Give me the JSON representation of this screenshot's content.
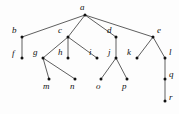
{
  "figure": {
    "name": "rooted-tree-diagram",
    "type": "node-link-tree",
    "background_color": "#fdfdfd",
    "node_color": "#111111",
    "edge_color": "#1a1a1a",
    "label_style": "italic-serif",
    "width": 179,
    "height": 114
  },
  "nodes": [
    {
      "id": "a",
      "label": "a",
      "x": 85,
      "y": 15,
      "label_x": 80,
      "label_y": 3,
      "level": 0
    },
    {
      "id": "b",
      "label": "b",
      "x": 22,
      "y": 37,
      "label_x": 12,
      "label_y": 26,
      "level": 1
    },
    {
      "id": "c",
      "label": "c",
      "x": 68,
      "y": 37,
      "label_x": 58,
      "label_y": 26,
      "level": 1
    },
    {
      "id": "d",
      "label": "d",
      "x": 116,
      "y": 37,
      "label_x": 107,
      "label_y": 26,
      "level": 1
    },
    {
      "id": "e",
      "label": "e",
      "x": 153,
      "y": 37,
      "label_x": 157,
      "label_y": 26,
      "level": 1
    },
    {
      "id": "f",
      "label": "f",
      "x": 22,
      "y": 58,
      "label_x": 12,
      "label_y": 49,
      "level": 2
    },
    {
      "id": "g",
      "label": "g",
      "x": 43,
      "y": 58,
      "label_x": 33,
      "label_y": 48,
      "level": 2
    },
    {
      "id": "h",
      "label": "h",
      "x": 68,
      "y": 58,
      "label_x": 58,
      "label_y": 48,
      "level": 2
    },
    {
      "id": "i",
      "label": "i",
      "x": 97,
      "y": 58,
      "label_x": 89,
      "label_y": 48,
      "level": 2
    },
    {
      "id": "j",
      "label": "j",
      "x": 116,
      "y": 58,
      "label_x": 108,
      "label_y": 48,
      "level": 2
    },
    {
      "id": "k",
      "label": "k",
      "x": 137,
      "y": 58,
      "label_x": 127,
      "label_y": 48,
      "level": 2
    },
    {
      "id": "l",
      "label": "l",
      "x": 165,
      "y": 58,
      "label_x": 169,
      "label_y": 48,
      "level": 2
    },
    {
      "id": "m",
      "label": "m",
      "x": 49,
      "y": 79,
      "label_x": 43,
      "label_y": 82,
      "level": 3
    },
    {
      "id": "n",
      "label": "n",
      "x": 75,
      "y": 79,
      "label_x": 70,
      "label_y": 82,
      "level": 3
    },
    {
      "id": "o",
      "label": "o",
      "x": 101,
      "y": 79,
      "label_x": 96,
      "label_y": 82,
      "level": 3
    },
    {
      "id": "p",
      "label": "p",
      "x": 127,
      "y": 79,
      "label_x": 122,
      "label_y": 82,
      "level": 3
    },
    {
      "id": "q",
      "label": "q",
      "x": 165,
      "y": 79,
      "label_x": 169,
      "label_y": 70,
      "level": 3
    },
    {
      "id": "r",
      "label": "r",
      "x": 165,
      "y": 101,
      "label_x": 169,
      "label_y": 93,
      "level": 4
    }
  ],
  "edges": [
    {
      "from": "a",
      "to": "b"
    },
    {
      "from": "a",
      "to": "c"
    },
    {
      "from": "a",
      "to": "d"
    },
    {
      "from": "a",
      "to": "e"
    },
    {
      "from": "b",
      "to": "f"
    },
    {
      "from": "c",
      "to": "g"
    },
    {
      "from": "c",
      "to": "h"
    },
    {
      "from": "c",
      "to": "i"
    },
    {
      "from": "d",
      "to": "j"
    },
    {
      "from": "e",
      "to": "k"
    },
    {
      "from": "e",
      "to": "l"
    },
    {
      "from": "g",
      "to": "m"
    },
    {
      "from": "g",
      "to": "n"
    },
    {
      "from": "j",
      "to": "o"
    },
    {
      "from": "j",
      "to": "p"
    },
    {
      "from": "l",
      "to": "q"
    },
    {
      "from": "q",
      "to": "r"
    }
  ]
}
